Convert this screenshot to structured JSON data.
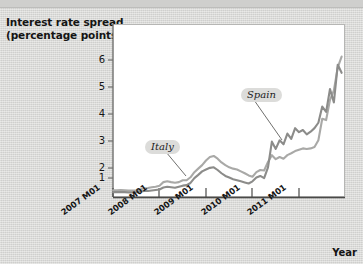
{
  "figure": {
    "title": "Interest rate spread\n(percentage points)",
    "xaxis_title": "Year",
    "background_color": "#d8d8d6",
    "plot_background_color": "#ffffff"
  },
  "chart_data": {
    "type": "line",
    "title": "Interest rate spread (percentage points)",
    "xlabel": "Year",
    "ylabel": "Interest rate spread (percentage points)",
    "xlim": [
      "2007 M01",
      "2011 M12"
    ],
    "ylim": [
      0,
      6.5
    ],
    "yticks": [
      1,
      2,
      3,
      4,
      5,
      6
    ],
    "ytick_labels": [
      "1",
      "2",
      "3",
      "4",
      "5",
      "6"
    ],
    "xticks": [
      "2007 M01",
      "2008 M01",
      "2009 M01",
      "2010 M01",
      "2011 M01"
    ],
    "xtick_labels": [
      "2007 M01",
      "2008 M01",
      "2009 M01",
      "2010 M01",
      "2011 M01"
    ],
    "grid": false,
    "legend_position": "inline-annotation",
    "annotations": [
      {
        "text": "Italy",
        "series": "Italy"
      },
      {
        "text": "Spain",
        "series": "Spain"
      }
    ],
    "x": [
      "2007 M01",
      "2007 M02",
      "2007 M03",
      "2007 M04",
      "2007 M05",
      "2007 M06",
      "2007 M07",
      "2007 M08",
      "2007 M09",
      "2007 M10",
      "2007 M11",
      "2007 M12",
      "2008 M01",
      "2008 M02",
      "2008 M03",
      "2008 M04",
      "2008 M05",
      "2008 M06",
      "2008 M07",
      "2008 M08",
      "2008 M09",
      "2008 M10",
      "2008 M11",
      "2008 M12",
      "2009 M01",
      "2009 M02",
      "2009 M03",
      "2009 M04",
      "2009 M05",
      "2009 M06",
      "2009 M07",
      "2009 M08",
      "2009 M09",
      "2009 M10",
      "2009 M11",
      "2009 M12",
      "2010 M01",
      "2010 M02",
      "2010 M03",
      "2010 M04",
      "2010 M05",
      "2010 M06",
      "2010 M07",
      "2010 M08",
      "2010 M09",
      "2010 M10",
      "2010 M11",
      "2010 M12",
      "2011 M01",
      "2011 M02",
      "2011 M03",
      "2011 M04",
      "2011 M05",
      "2011 M06",
      "2011 M07",
      "2011 M08",
      "2011 M09",
      "2011 M10",
      "2011 M11",
      "2011 M12"
    ],
    "series": [
      {
        "name": "Italy",
        "color": "#a9a9a7",
        "values": [
          0.25,
          0.25,
          0.26,
          0.25,
          0.24,
          0.24,
          0.25,
          0.28,
          0.32,
          0.33,
          0.36,
          0.38,
          0.42,
          0.55,
          0.58,
          0.55,
          0.53,
          0.55,
          0.62,
          0.62,
          0.73,
          0.92,
          1.05,
          1.18,
          1.35,
          1.48,
          1.52,
          1.42,
          1.28,
          1.18,
          1.1,
          1.05,
          1.02,
          0.95,
          0.88,
          0.8,
          0.75,
          0.92,
          1.0,
          0.98,
          1.3,
          1.55,
          1.4,
          1.48,
          1.42,
          1.55,
          1.62,
          1.7,
          1.75,
          1.8,
          1.78,
          1.8,
          1.85,
          2.1,
          2.9,
          2.85,
          3.6,
          3.95,
          4.8,
          5.2
        ]
      },
      {
        "name": "Spain",
        "color": "#8c8c8a",
        "values": [
          0.18,
          0.18,
          0.18,
          0.18,
          0.17,
          0.17,
          0.18,
          0.2,
          0.22,
          0.22,
          0.24,
          0.26,
          0.28,
          0.35,
          0.38,
          0.36,
          0.34,
          0.38,
          0.42,
          0.44,
          0.52,
          0.7,
          0.82,
          0.95,
          1.02,
          1.08,
          1.1,
          1.0,
          0.88,
          0.78,
          0.72,
          0.66,
          0.62,
          0.58,
          0.54,
          0.5,
          0.58,
          0.72,
          0.78,
          0.7,
          1.1,
          2.05,
          1.78,
          2.1,
          1.95,
          2.35,
          2.15,
          2.55,
          2.4,
          2.48,
          2.32,
          2.42,
          2.55,
          2.75,
          3.35,
          3.15,
          4.0,
          3.5,
          4.9,
          4.6
        ]
      }
    ]
  },
  "labels": {
    "italy": "Italy",
    "spain": "Spain"
  }
}
